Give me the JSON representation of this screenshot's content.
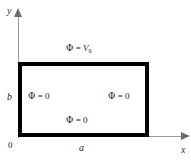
{
  "figure": {
    "background_color": "#ffffff",
    "wall_color": "#000000",
    "axis_color": "#9a9a9a"
  },
  "axes": {
    "y_label": "y",
    "x_label": "x",
    "origin_label": "0"
  },
  "dimensions": {
    "width_label": "a",
    "height_label": "b"
  },
  "boundary_conditions": {
    "top": {
      "symbol": "Φ",
      "equals": "=",
      "value": "V",
      "subscript": "0",
      "full_text": "Φ = V₀"
    },
    "left": {
      "symbol": "Φ",
      "equals": "=",
      "value": "0",
      "full_text": "Φ = 0"
    },
    "right": {
      "symbol": "Φ",
      "equals": "=",
      "value": "0",
      "full_text": "Φ = 0"
    },
    "bottom": {
      "symbol": "Φ",
      "equals": "=",
      "value": "0",
      "full_text": "Φ = 0"
    }
  }
}
